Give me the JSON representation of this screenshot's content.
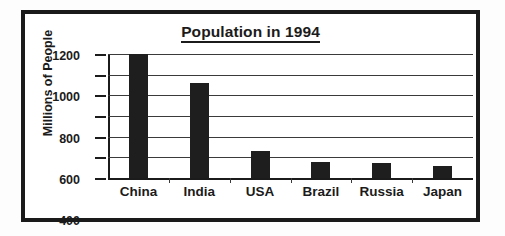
{
  "chart_data": {
    "type": "bar",
    "title": "Population in 1994",
    "xlabel": "",
    "ylabel": "Millions of People",
    "categories": [
      "China",
      "India",
      "USA",
      "Brazil",
      "Russia",
      "Japan"
    ],
    "values": [
      1200,
      920,
      260,
      155,
      145,
      120
    ],
    "yticks": [
      0,
      200,
      400,
      600,
      800,
      1000,
      1200
    ],
    "ytick_labels": [
      "0",
      "200",
      "400",
      "600",
      "800",
      "1000",
      "1200"
    ],
    "ylim": [
      0,
      1200
    ],
    "grid": true,
    "legend": false,
    "bar_color": "#1e1e1e",
    "axis_color": "#1b1b1b",
    "background": "#ffffff",
    "frame_color": "#1a1a1a"
  }
}
